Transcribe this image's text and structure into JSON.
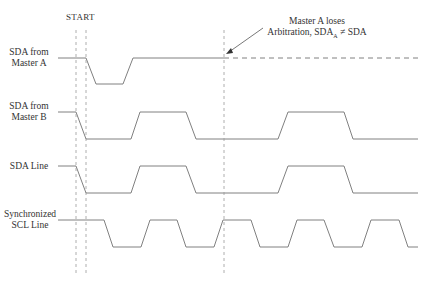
{
  "title": "START",
  "annotation": {
    "line1": "Master A loses",
    "line2_prefix": "Arbitration, SDA",
    "line2_sub": "A",
    "line2_suffix": " ≠ SDA"
  },
  "signals": [
    {
      "id": "sda-master-a",
      "label_line1": "SDA from",
      "label_line2": "Master A"
    },
    {
      "id": "sda-master-b",
      "label_line1": "SDA from",
      "label_line2": "Master B"
    },
    {
      "id": "sda-line",
      "label_line1": "SDA Line",
      "label_line2": ""
    },
    {
      "id": "scl-line",
      "label_line1": "Synchronized",
      "label_line2": "SCL Line"
    }
  ],
  "colors": {
    "waveform": "#808080",
    "dashed": "#999999",
    "text": "#333333"
  }
}
